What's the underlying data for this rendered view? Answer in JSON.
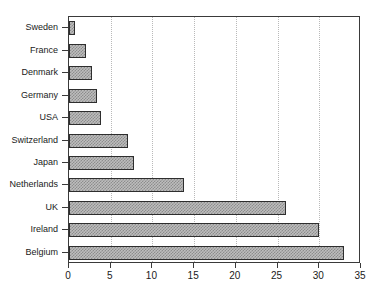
{
  "chart_data": {
    "type": "bar",
    "orientation": "horizontal",
    "title": "",
    "subtitle": "",
    "xlabel": "",
    "ylabel": "",
    "xlim": [
      0,
      35
    ],
    "xticks": [
      0,
      5,
      10,
      15,
      20,
      25,
      30,
      35
    ],
    "xtick_labels": [
      "0",
      "5",
      "10",
      "15",
      "20",
      "25",
      "30",
      "35"
    ],
    "grid": "vertical-dotted",
    "legend": "none",
    "categories": [
      "Sweden",
      "France",
      "Denmark",
      "Germany",
      "USA",
      "Switzerland",
      "Japan",
      "Netherlands",
      "UK",
      "Ireland",
      "Belgium"
    ],
    "values": [
      0.7,
      2.0,
      2.8,
      3.3,
      3.8,
      7.1,
      7.8,
      13.8,
      26.0,
      30.0,
      33.0
    ],
    "bar_fill_color": "#bdbdbd",
    "bar_pattern_color": "#8d8d8d",
    "bar_edge_color": "#2e2e2e",
    "axis_color": "#3a3a3a",
    "gridline_color": "#b9b9b9",
    "background_color": "#ffffff"
  }
}
